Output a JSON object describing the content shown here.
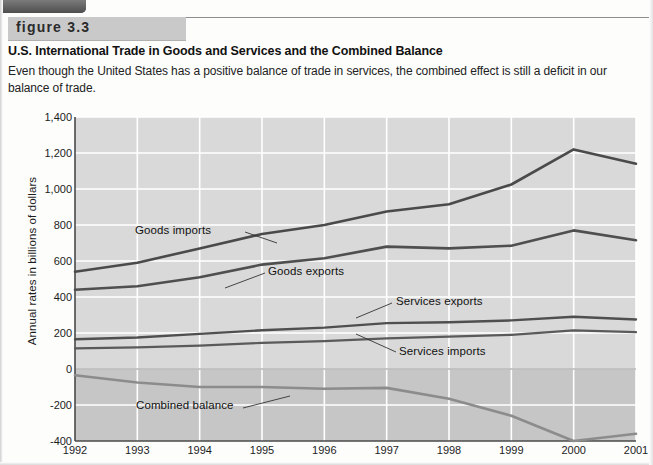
{
  "figure": {
    "banner_label": "figure 3.3",
    "title": "U.S. International Trade in Goods and Services and the Combined Balance",
    "caption": "Even though the United States has a positive balance of trade in services, the combined effect is still a deficit in our balance of trade."
  },
  "colors": {
    "plot_background": "#d9d9d9",
    "negative_band": "#c6c6c6",
    "gridline": "#ffffff",
    "axis": "#4a4a4a",
    "goods_imports": "#4a4a4a",
    "goods_exports": "#4f4f4f",
    "services_exports": "#4f4f4f",
    "services_imports": "#5a5a5a",
    "combined_balance": "#8c8c8c",
    "banner": "#c9c9c9"
  },
  "chart_data": {
    "type": "line",
    "title": "U.S. International Trade in Goods and Services and the Combined Balance",
    "xlabel": "",
    "ylabel": "Annual rates in billions of dollars",
    "x": [
      1992,
      1993,
      1994,
      1995,
      1996,
      1997,
      1998,
      1999,
      2000,
      2001
    ],
    "xticklabels": [
      "1992",
      "1993",
      "1994",
      "1995",
      "1996",
      "1997",
      "1998",
      "1999",
      "2000",
      "2001"
    ],
    "yticklabels": [
      "1,400",
      "1,200",
      "1,000",
      "800",
      "600",
      "400",
      "200",
      "0",
      "-200",
      "-400"
    ],
    "ytickvalues": [
      1400,
      1200,
      1000,
      800,
      600,
      400,
      200,
      0,
      -200,
      -400
    ],
    "ylim": [
      -400,
      1400
    ],
    "xlim": [
      1992,
      2001
    ],
    "grid": true,
    "legend_position": "inline-annotations",
    "series": [
      {
        "name": "Goods imports",
        "values": [
          540,
          590,
          670,
          750,
          800,
          875,
          915,
          1025,
          1220,
          1140
        ],
        "label_x": 1992.75,
        "label_y": 790
      },
      {
        "name": "Goods exports",
        "values": [
          440,
          460,
          510,
          580,
          615,
          680,
          670,
          685,
          770,
          715
        ],
        "label_x": 1995.0,
        "label_y": 555
      },
      {
        "name": "Services exports",
        "values": [
          165,
          175,
          195,
          215,
          230,
          255,
          260,
          270,
          290,
          275
        ],
        "label_x": 1998.0,
        "label_y": 400
      },
      {
        "name": "Services imports",
        "values": [
          115,
          120,
          130,
          145,
          155,
          170,
          180,
          190,
          215,
          205
        ],
        "label_x": 1998.0,
        "label_y": 245
      },
      {
        "name": "Combined balance",
        "values": [
          -35,
          -75,
          -100,
          -100,
          -110,
          -105,
          -165,
          -260,
          -400,
          -360
        ],
        "label_x": 1993.6,
        "label_y": -255
      }
    ]
  }
}
